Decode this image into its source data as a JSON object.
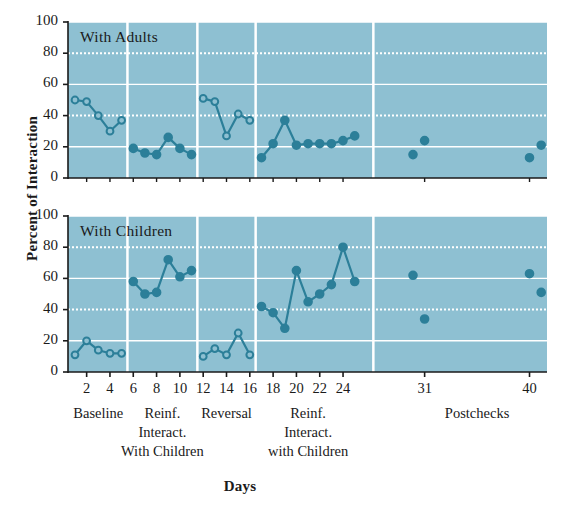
{
  "figure": {
    "y_axis_title": "Percent of Interaction",
    "x_axis_title": "Days",
    "panels": [
      {
        "title": "With Adults"
      },
      {
        "title": "With Children"
      }
    ],
    "y_ticks": [
      "0",
      "20",
      "40",
      "60",
      "80",
      "100"
    ],
    "x_ticks": [
      "2",
      "4",
      "6",
      "8",
      "10",
      "12",
      "14",
      "16",
      "18",
      "20",
      "22",
      "24",
      "31",
      "40"
    ],
    "phase_labels": [
      "Baseline",
      "Reinf.\nInteract.\nWith Children",
      "Reversal",
      "Reinf.\nInteract.\nwith Children",
      "Postchecks"
    ],
    "colors": {
      "plot_background": "#8ec0d2",
      "gridline": "#ffffff",
      "separator": "#ffffff",
      "marker": "#2c7f99",
      "line": "#2c7f99",
      "axis": "#1a1a1a",
      "page_background": "#ffffff"
    }
  },
  "chart_data": {
    "type": "line",
    "title": "",
    "xlabel": "Days",
    "ylabel": "Percent of Interaction",
    "xlim": [
      0.4,
      41.5
    ],
    "ylim": [
      0,
      100
    ],
    "grid": true,
    "legend": "none",
    "marker_styles": {
      "open": "open circle — baseline and reversal phases",
      "filled": "filled circle — reinforcement phases and postchecks"
    },
    "phases": [
      {
        "name": "Baseline",
        "x_range": [
          1,
          5
        ],
        "marker": "open"
      },
      {
        "name": "Reinf. Interact. With Children",
        "x_range": [
          6,
          11
        ],
        "marker": "filled"
      },
      {
        "name": "Reversal",
        "x_range": [
          12,
          16
        ],
        "marker": "open"
      },
      {
        "name": "Reinf. Interact. with Children",
        "x_range": [
          17,
          25
        ],
        "marker": "filled"
      },
      {
        "name": "Postchecks",
        "x_range": [
          30,
          41
        ],
        "marker": "filled"
      }
    ],
    "panels": [
      {
        "title": "With Adults",
        "series": [
          {
            "name": "Baseline",
            "marker": "open",
            "connected": true,
            "x": [
              1,
              2,
              3,
              4,
              5
            ],
            "values": [
              50,
              49,
              40,
              30,
              37
            ]
          },
          {
            "name": "Reinf. Interact. With Children",
            "marker": "filled",
            "connected": true,
            "x": [
              6,
              7,
              8,
              9,
              10,
              11
            ],
            "values": [
              19,
              16,
              15,
              26,
              19,
              15
            ]
          },
          {
            "name": "Reversal",
            "marker": "open",
            "connected": true,
            "x": [
              12,
              13,
              14,
              15,
              16
            ],
            "values": [
              51,
              49,
              27,
              41,
              37
            ]
          },
          {
            "name": "Reinf. Interact. with Children",
            "marker": "filled",
            "connected": true,
            "x": [
              17,
              18,
              19,
              20,
              21,
              22,
              23,
              24,
              25
            ],
            "values": [
              13,
              22,
              37,
              21,
              22,
              22,
              22,
              24,
              27
            ]
          },
          {
            "name": "Postchecks",
            "marker": "filled",
            "connected": false,
            "x": [
              30,
              31,
              40,
              41
            ],
            "values": [
              15,
              24,
              13,
              21
            ]
          }
        ]
      },
      {
        "title": "With Children",
        "series": [
          {
            "name": "Baseline",
            "marker": "open",
            "connected": true,
            "x": [
              1,
              2,
              3,
              4,
              5
            ],
            "values": [
              11,
              20,
              14,
              12,
              12
            ]
          },
          {
            "name": "Reinf. Interact. With Children",
            "marker": "filled",
            "connected": true,
            "x": [
              6,
              7,
              8,
              9,
              10,
              11
            ],
            "values": [
              58,
              50,
              51,
              72,
              61,
              65
            ]
          },
          {
            "name": "Reversal",
            "marker": "open",
            "connected": true,
            "x": [
              12,
              13,
              14,
              15,
              16
            ],
            "values": [
              10,
              15,
              11,
              25,
              11
            ]
          },
          {
            "name": "Reinf. Interact. with Children",
            "marker": "filled",
            "connected": true,
            "x": [
              17,
              18,
              19,
              20,
              21,
              22,
              23,
              24,
              25
            ],
            "values": [
              42,
              38,
              28,
              65,
              45,
              50,
              56,
              80,
              58
            ]
          },
          {
            "name": "Postchecks",
            "marker": "filled",
            "connected": false,
            "x": [
              30,
              31,
              40,
              41
            ],
            "values": [
              62,
              34,
              63,
              51
            ]
          }
        ]
      }
    ]
  }
}
